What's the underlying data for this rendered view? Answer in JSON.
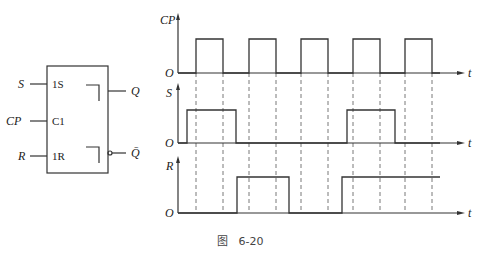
{
  "flipflop": {
    "inputs": [
      {
        "name": "S",
        "pin": "1S"
      },
      {
        "name": "CP",
        "pin": "C1"
      },
      {
        "name": "R",
        "pin": "1R"
      }
    ],
    "outputs": [
      {
        "name": "Q"
      },
      {
        "name": "Q̄"
      }
    ]
  },
  "timing": {
    "signals": [
      {
        "label": "CP",
        "origin": "O",
        "axis": "t"
      },
      {
        "label": "S",
        "origin": "O",
        "axis": "t"
      },
      {
        "label": "R",
        "origin": "O",
        "axis": "t"
      }
    ],
    "waveforms": {
      "CP": [
        [
          196,
          223
        ],
        [
          249,
          276
        ],
        [
          301,
          328
        ],
        [
          353,
          380
        ],
        [
          405,
          432
        ]
      ],
      "S": [
        [
          187,
          236
        ],
        [
          347,
          395
        ]
      ],
      "R": [
        [
          237,
          289
        ],
        [
          342,
          440
        ]
      ]
    }
  },
  "caption": "图   6-20"
}
